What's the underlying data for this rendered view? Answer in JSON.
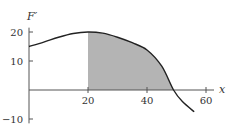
{
  "chart_data": {
    "type": "area",
    "title": "",
    "xlabel": "x",
    "ylabel": "F′",
    "xlim": [
      0,
      62
    ],
    "ylim": [
      -10,
      22
    ],
    "xticks": [
      20,
      40,
      60
    ],
    "yticks": [
      20,
      10,
      -10
    ],
    "xtick_labels": [
      "20",
      "40",
      "60"
    ],
    "ytick_labels": [
      "20",
      "10",
      "−10"
    ],
    "grid": false,
    "legend": null,
    "series": [
      {
        "name": "F′(x)",
        "x": [
          0,
          5,
          10,
          15,
          20,
          25,
          30,
          35,
          40,
          45,
          49,
          52,
          56
        ],
        "y": [
          15,
          16.5,
          18.2,
          19.5,
          20,
          19.6,
          18.2,
          16.3,
          13.8,
          8.2,
          0,
          -4,
          -7.5
        ]
      }
    ],
    "shaded_region": {
      "from_x": 20,
      "to_x": 49,
      "color": "#b4b4b4",
      "description": "area under F′ from x=20 to the zero crossing"
    },
    "colors": {
      "curve": "#222222",
      "axis": "#555555",
      "shade": "#b4b4b4"
    }
  }
}
